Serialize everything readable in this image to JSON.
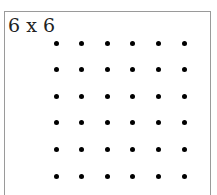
{
  "diagram": {
    "label": "6 x 6",
    "grid": {
      "rows": 6,
      "cols": 6,
      "origin_x": 56,
      "origin_y": 43,
      "spacing_x": 25.6,
      "spacing_y": 26.6,
      "dot_color": "#000000"
    },
    "frame_border_color": "#9a9a9a"
  }
}
